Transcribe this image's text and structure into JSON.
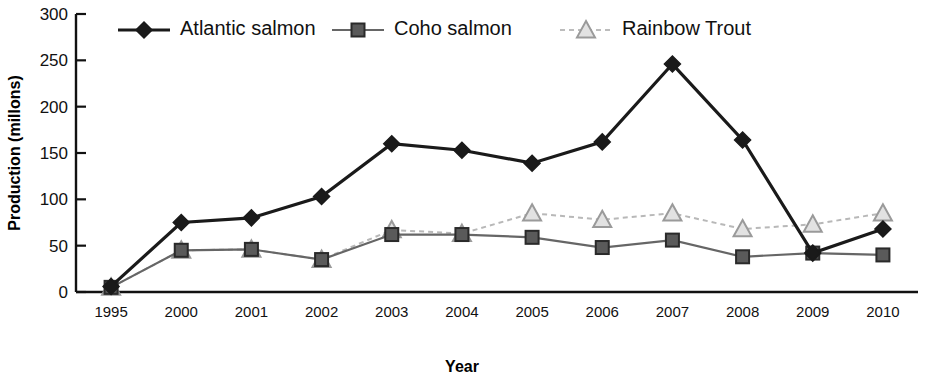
{
  "chart_data": {
    "type": "line",
    "title": "",
    "xlabel": "Year",
    "ylabel": "Production (millons)",
    "categories": [
      "1995",
      "2000",
      "2001",
      "2002",
      "2003",
      "2004",
      "2005",
      "2006",
      "2007",
      "2008",
      "2009",
      "2010"
    ],
    "ylim": [
      0,
      300
    ],
    "yticks": [
      0,
      50,
      100,
      150,
      200,
      250,
      300
    ],
    "ytick_labels": [
      "0",
      "50",
      "100",
      "150",
      "200",
      "250",
      "300"
    ],
    "grid": false,
    "legend_position": "top",
    "series": [
      {
        "name": "Atlantic salmon",
        "marker": "diamond",
        "color": "#1a1a1a",
        "line_style": "solid",
        "values": [
          6,
          75,
          80,
          103,
          160,
          153,
          139,
          162,
          246,
          164,
          42,
          68
        ]
      },
      {
        "name": "Coho salmon",
        "marker": "square",
        "color": "#5a5a5a",
        "line_style": "solid",
        "values": [
          5,
          45,
          46,
          35,
          62,
          62,
          59,
          48,
          56,
          38,
          42,
          40
        ]
      },
      {
        "name": "Rainbow Trout",
        "marker": "triangle",
        "color": "#c0c0c0",
        "line_style": "dashed",
        "values": [
          5,
          45,
          46,
          35,
          67,
          63,
          85,
          78,
          85,
          68,
          73,
          85
        ]
      }
    ]
  },
  "axes": {
    "y_axis_title": "Production (millons)",
    "x_axis_title": "Year"
  },
  "legend": {
    "items": [
      {
        "label": "Atlantic salmon",
        "marker": "diamond-icon"
      },
      {
        "label": "Coho salmon",
        "marker": "square-icon"
      },
      {
        "label": "Rainbow Trout",
        "marker": "triangle-icon"
      }
    ]
  },
  "colors": {
    "atlantic": "#1a1a1a",
    "coho": "#5a5a5a",
    "rainbow": "#c8c8c8",
    "axis": "#111111",
    "background": "#ffffff"
  }
}
